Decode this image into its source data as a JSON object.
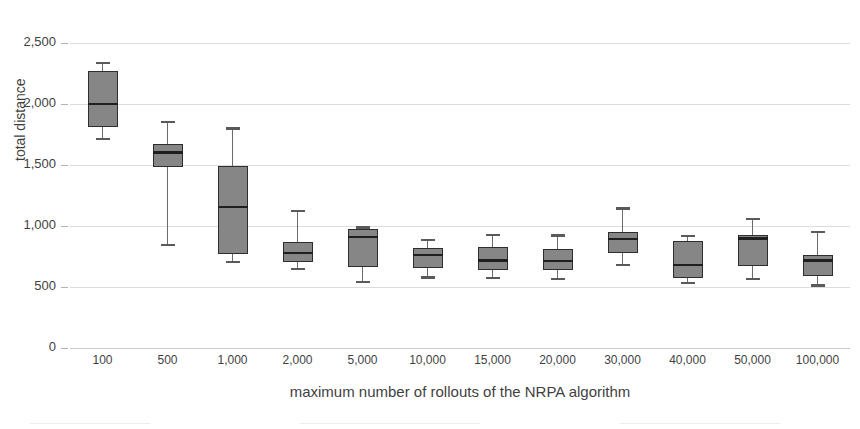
{
  "caption": {
    "top_partial_text": ""
  },
  "chart_data": {
    "type": "box",
    "title": "",
    "xlabel": "maximum number of rollouts of the NRPA algorithm",
    "ylabel": "total distance",
    "ylim": [
      0,
      2500
    ],
    "yticks": [
      0,
      500,
      1000,
      1500,
      2000,
      2500
    ],
    "ytick_labels": [
      "0",
      "500",
      "1,000",
      "1,500",
      "2,000",
      "2,500"
    ],
    "grid": true,
    "legend": "none",
    "box_fill_color": "#868686",
    "box_edge_color": "#2e2e2e",
    "categories": [
      "100",
      "500",
      "1,000",
      "2,000",
      "5,000",
      "10,000",
      "15,000",
      "20,000",
      "30,000",
      "40,000",
      "50,000",
      "100,000"
    ],
    "boxes": [
      {
        "category": "100",
        "whisker_low": 1715,
        "q1": 1810,
        "median": 2000,
        "q3": 2270,
        "whisker_high": 2340
      },
      {
        "category": "500",
        "whisker_low": 845,
        "q1": 1485,
        "median": 1605,
        "q3": 1670,
        "whisker_high": 1855
      },
      {
        "category": "1,000",
        "whisker_low": 705,
        "q1": 770,
        "median": 1155,
        "q3": 1490,
        "whisker_high": 1800
      },
      {
        "category": "2,000",
        "whisker_low": 650,
        "q1": 705,
        "median": 780,
        "q3": 865,
        "whisker_high": 1125
      },
      {
        "category": "5,000",
        "whisker_low": 545,
        "q1": 665,
        "median": 910,
        "q3": 975,
        "whisker_high": 990
      },
      {
        "category": "10,000",
        "whisker_low": 580,
        "q1": 655,
        "median": 765,
        "q3": 820,
        "whisker_high": 885
      },
      {
        "category": "15,000",
        "whisker_low": 575,
        "q1": 640,
        "median": 720,
        "q3": 830,
        "whisker_high": 930
      },
      {
        "category": "20,000",
        "whisker_low": 565,
        "q1": 640,
        "median": 715,
        "q3": 810,
        "whisker_high": 925
      },
      {
        "category": "30,000",
        "whisker_low": 680,
        "q1": 775,
        "median": 895,
        "q3": 950,
        "whisker_high": 1145
      },
      {
        "category": "40,000",
        "whisker_low": 535,
        "q1": 575,
        "median": 680,
        "q3": 880,
        "whisker_high": 920
      },
      {
        "category": "50,000",
        "whisker_low": 565,
        "q1": 670,
        "median": 900,
        "q3": 925,
        "whisker_high": 1060
      },
      {
        "category": "100,000",
        "whisker_low": 515,
        "q1": 590,
        "median": 720,
        "q3": 760,
        "whisker_high": 950
      }
    ]
  }
}
